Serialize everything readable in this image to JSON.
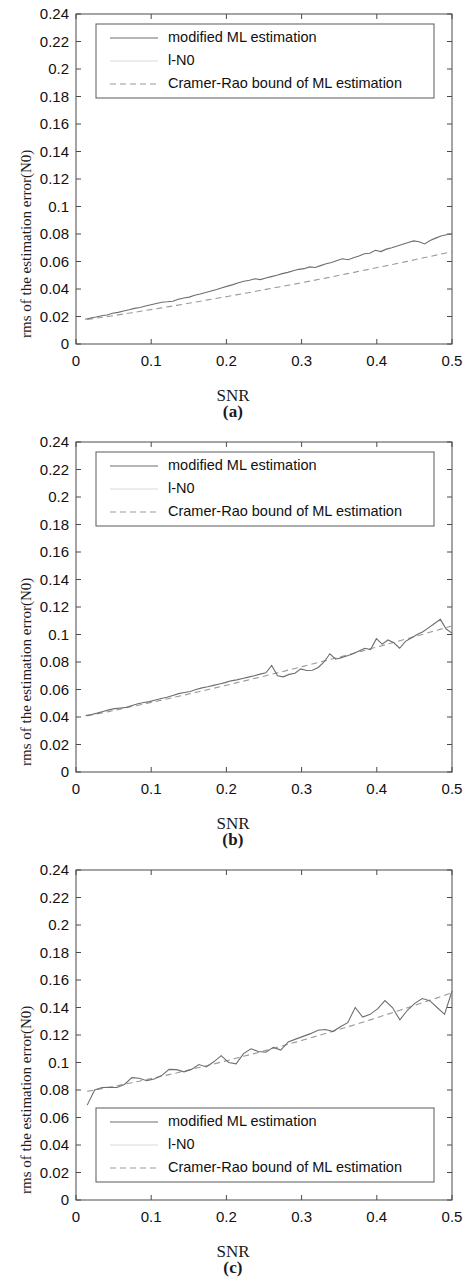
{
  "figure": {
    "panels": [
      {
        "key": "a",
        "panel_label": "(a)",
        "xlabel": "SNR",
        "ylabel": "rms of the estimation error(N0)",
        "legend_position": "top",
        "legend": [
          {
            "label": "modified ML estimation",
            "style": "solid"
          },
          {
            "label": "l-N0",
            "style": "faint"
          },
          {
            "label": "Cramer-Rao bound of ML estimation",
            "style": "dashed"
          }
        ],
        "xticks": [
          "0",
          "0.1",
          "0.2",
          "0.3",
          "0.4",
          "0.5"
        ],
        "yticks": [
          "0",
          "0.02",
          "0.04",
          "0.06",
          "0.08",
          "0.1",
          "0.12",
          "0.14",
          "0.16",
          "0.18",
          "0.2",
          "0.22",
          "0.24"
        ]
      },
      {
        "key": "b",
        "panel_label": "(b)",
        "xlabel": "SNR",
        "ylabel": "rms of the estimation error(N0)",
        "legend_position": "top",
        "legend": [
          {
            "label": "modified ML estimation",
            "style": "solid"
          },
          {
            "label": "l-N0",
            "style": "faint"
          },
          {
            "label": "Cramer-Rao bound of ML estimation",
            "style": "dashed"
          }
        ],
        "xticks": [
          "0",
          "0.1",
          "0.2",
          "0.3",
          "0.4",
          "0.5"
        ],
        "yticks": [
          "0",
          "0.02",
          "0.04",
          "0.06",
          "0.08",
          "0.1",
          "0.12",
          "0.14",
          "0.16",
          "0.18",
          "0.2",
          "0.22",
          "0.24"
        ]
      },
      {
        "key": "c",
        "panel_label": "(c)",
        "xlabel": "SNR",
        "ylabel": "rms of the estimation error(N0)",
        "legend_position": "bottom",
        "legend": [
          {
            "label": "modified ML estimation",
            "style": "solid"
          },
          {
            "label": "l-N0",
            "style": "faint"
          },
          {
            "label": "Cramer-Rao bound of ML estimation",
            "style": "dashed"
          }
        ],
        "xticks": [
          "0",
          "0.1",
          "0.2",
          "0.3",
          "0.4",
          "0.5"
        ],
        "yticks": [
          "0",
          "0.02",
          "0.04",
          "0.06",
          "0.08",
          "0.1",
          "0.12",
          "0.14",
          "0.16",
          "0.18",
          "0.2",
          "0.22",
          "0.24"
        ]
      }
    ]
  },
  "chart_data": [
    {
      "type": "line",
      "title": "(a)",
      "xlabel": "SNR",
      "ylabel": "rms of the estimation error(N0)",
      "xlim": [
        0,
        0.5
      ],
      "ylim": [
        0,
        0.24
      ],
      "grid": false,
      "legend_position": "upper center",
      "x": [
        0.01,
        0.02,
        0.03,
        0.04,
        0.05,
        0.06,
        0.07,
        0.08,
        0.09,
        0.1,
        0.11,
        0.12,
        0.13,
        0.14,
        0.15,
        0.16,
        0.17,
        0.18,
        0.19,
        0.2,
        0.21,
        0.22,
        0.23,
        0.24,
        0.25,
        0.26,
        0.27,
        0.28,
        0.29,
        0.3,
        0.31,
        0.32,
        0.33,
        0.34,
        0.35,
        0.36,
        0.37,
        0.38,
        0.39,
        0.4,
        0.41,
        0.42,
        0.43,
        0.44,
        0.45,
        0.46,
        0.47,
        0.48,
        0.49,
        0.5
      ],
      "series": [
        {
          "name": "modified ML estimation",
          "style": "solid",
          "values": [
            0.018,
            0.0189,
            0.0196,
            0.0206,
            0.0211,
            0.0224,
            0.023,
            0.024,
            0.0249,
            0.0259,
            0.0266,
            0.0276,
            0.0286,
            0.0295,
            0.0304,
            0.0307,
            0.0311,
            0.0326,
            0.0335,
            0.0341,
            0.0354,
            0.0363,
            0.0374,
            0.0386,
            0.0396,
            0.0409,
            0.0421,
            0.0432,
            0.0445,
            0.0456,
            0.0464,
            0.0474,
            0.0468,
            0.048,
            0.049,
            0.05,
            0.0512,
            0.0521,
            0.0533,
            0.0543,
            0.0548,
            0.0561,
            0.0556,
            0.057,
            0.0583,
            0.0593,
            0.0607,
            0.062,
            0.0613,
            0.0627
          ],
          "values_tail": [
            0.064,
            0.0656,
            0.066,
            0.0682,
            0.0672,
            0.069,
            0.07,
            0.0713,
            0.0726,
            0.0738,
            0.075,
            0.0744,
            0.0728,
            0.0752,
            0.077,
            0.0785,
            0.0795,
            0.08
          ]
        },
        {
          "name": "Cramer-Rao bound of ML estimation",
          "style": "dashed",
          "values": [
            0.0178,
            0.0186,
            0.0194,
            0.0202,
            0.021,
            0.0219,
            0.0227,
            0.0236,
            0.0245,
            0.0254,
            0.0263,
            0.0272,
            0.0281,
            0.029,
            0.03,
            0.0309,
            0.0319,
            0.0328,
            0.0338,
            0.0347,
            0.0357,
            0.0367,
            0.0377,
            0.0387,
            0.0397,
            0.0407,
            0.0417,
            0.0427,
            0.0437,
            0.0448,
            0.0458,
            0.0469,
            0.0479,
            0.049,
            0.0501,
            0.0512,
            0.0523,
            0.0534,
            0.0545,
            0.0556,
            0.0567,
            0.0578,
            0.059,
            0.0601,
            0.0613,
            0.0625,
            0.0636,
            0.0648,
            0.066,
            0.0672
          ]
        },
        {
          "name": "l-N0",
          "style": "faint",
          "values": []
        }
      ],
      "value_range_note": "start ~0.018 at SNR=0.01, end ~0.080 at SNR=0.5"
    },
    {
      "type": "line",
      "title": "(b)",
      "xlabel": "SNR",
      "ylabel": "rms of the estimation error(N0)",
      "xlim": [
        0,
        0.5
      ],
      "ylim": [
        0,
        0.24
      ],
      "grid": false,
      "legend_position": "upper center",
      "x": [
        0.01,
        0.02,
        0.03,
        0.04,
        0.05,
        0.06,
        0.07,
        0.08,
        0.09,
        0.1,
        0.11,
        0.12,
        0.13,
        0.14,
        0.15,
        0.16,
        0.17,
        0.18,
        0.19,
        0.2,
        0.21,
        0.22,
        0.23,
        0.24,
        0.25,
        0.26,
        0.27,
        0.28,
        0.29,
        0.3,
        0.31,
        0.32,
        0.33,
        0.34,
        0.35,
        0.36,
        0.37,
        0.38,
        0.39,
        0.4,
        0.41,
        0.42,
        0.43,
        0.44,
        0.45,
        0.46,
        0.47,
        0.48,
        0.49,
        0.5
      ],
      "series": [
        {
          "name": "modified ML estimation",
          "style": "solid",
          "values": [
            0.041,
            0.0418,
            0.0428,
            0.044,
            0.0452,
            0.0461,
            0.0466,
            0.047,
            0.0483,
            0.0496,
            0.0505,
            0.0512,
            0.0524,
            0.0535,
            0.0543,
            0.0556,
            0.057,
            0.0578,
            0.0585,
            0.06,
            0.0612,
            0.062,
            0.063,
            0.064,
            0.065,
            0.0663,
            0.067,
            0.068,
            0.069,
            0.07,
            0.0712,
            0.0722,
            0.0775,
            0.07,
            0.0692,
            0.071,
            0.0718,
            0.075,
            0.0738,
            0.074,
            0.076,
            0.08,
            0.086,
            0.082,
            0.0832,
            0.0845,
            0.086,
            0.088,
            0.09,
            0.089
          ],
          "values_tail": [
            0.097,
            0.093,
            0.096,
            0.094,
            0.09,
            0.095,
            0.0975,
            0.1,
            0.102,
            0.105,
            0.108,
            0.111,
            0.104,
            0.101
          ]
        },
        {
          "name": "Cramer-Rao bound of ML estimation",
          "style": "dashed",
          "values": [
            0.0408,
            0.0419,
            0.043,
            0.0441,
            0.0452,
            0.0464,
            0.0476,
            0.0487,
            0.0499,
            0.0511,
            0.0523,
            0.0535,
            0.0547,
            0.0559,
            0.0572,
            0.0584,
            0.0597,
            0.0609,
            0.0622,
            0.0635,
            0.0648,
            0.0661,
            0.0674,
            0.0687,
            0.07,
            0.0714,
            0.0727,
            0.0741,
            0.0754,
            0.0768,
            0.0782,
            0.0796,
            0.081,
            0.0824,
            0.0838,
            0.0852,
            0.0867,
            0.0881,
            0.0896,
            0.091,
            0.0925,
            0.094,
            0.0955,
            0.097,
            0.0985,
            0.1,
            0.1016,
            0.1031,
            0.1047,
            0.1062
          ]
        },
        {
          "name": "l-N0",
          "style": "faint",
          "values": []
        }
      ],
      "value_range_note": "start ~0.041 at SNR=0.01, end ~0.101 at SNR=0.5 with peak ~0.111 near 0.48"
    },
    {
      "type": "line",
      "title": "(c)",
      "xlabel": "SNR",
      "ylabel": "rms of the estimation error(N0)",
      "xlim": [
        0,
        0.5
      ],
      "ylim": [
        0,
        0.24
      ],
      "grid": false,
      "legend_position": "lower center",
      "x": [
        0.01,
        0.02,
        0.03,
        0.04,
        0.05,
        0.06,
        0.07,
        0.08,
        0.09,
        0.1,
        0.11,
        0.12,
        0.13,
        0.14,
        0.15,
        0.16,
        0.17,
        0.18,
        0.19,
        0.2,
        0.21,
        0.22,
        0.23,
        0.24,
        0.25,
        0.26,
        0.27,
        0.28,
        0.29,
        0.3,
        0.31,
        0.32,
        0.33,
        0.34,
        0.35,
        0.36,
        0.37,
        0.38,
        0.39,
        0.4,
        0.41,
        0.42,
        0.43,
        0.44,
        0.45,
        0.46,
        0.47,
        0.48,
        0.49,
        0.5
      ],
      "series": [
        {
          "name": "modified ML estimation",
          "style": "solid",
          "values": [
            0.069,
            0.08,
            0.0818,
            0.082,
            0.0818,
            0.084,
            0.089,
            0.0885,
            0.0868,
            0.088,
            0.0905,
            0.095,
            0.0948,
            0.0932,
            0.095,
            0.0985,
            0.0968,
            0.1005,
            0.105,
            0.1,
            0.099,
            0.1065,
            0.11,
            0.108,
            0.1075,
            0.111,
            0.109,
            0.115,
            0.117,
            0.119,
            0.121,
            0.1235,
            0.124,
            0.1225,
            0.126,
            0.129,
            0.14,
            0.133,
            0.135,
            0.139,
            0.145,
            0.14,
            0.131,
            0.138,
            0.143,
            0.1465,
            0.145,
            0.14,
            0.135,
            0.152
          ],
          "values_tail": []
        },
        {
          "name": "Cramer-Rao bound of ML estimation",
          "style": "dashed",
          "values": [
            0.079,
            0.08,
            0.081,
            0.082,
            0.0831,
            0.0842,
            0.0853,
            0.0864,
            0.0876,
            0.0888,
            0.09,
            0.0912,
            0.0924,
            0.0937,
            0.095,
            0.0963,
            0.0976,
            0.0989,
            0.1003,
            0.1017,
            0.1031,
            0.1045,
            0.1059,
            0.1073,
            0.1088,
            0.1103,
            0.1118,
            0.1133,
            0.1148,
            0.1163,
            0.1179,
            0.1195,
            0.1211,
            0.1227,
            0.1243,
            0.126,
            0.1276,
            0.1293,
            0.131,
            0.1327,
            0.1345,
            0.1362,
            0.138,
            0.1398,
            0.1416,
            0.1434,
            0.1452,
            0.147,
            0.1489,
            0.1508
          ]
        },
        {
          "name": "l-N0",
          "style": "faint",
          "values": []
        }
      ],
      "value_range_note": "start ~0.069 at SNR=0.01, rises to ~0.152 at SNR=0.5"
    }
  ]
}
